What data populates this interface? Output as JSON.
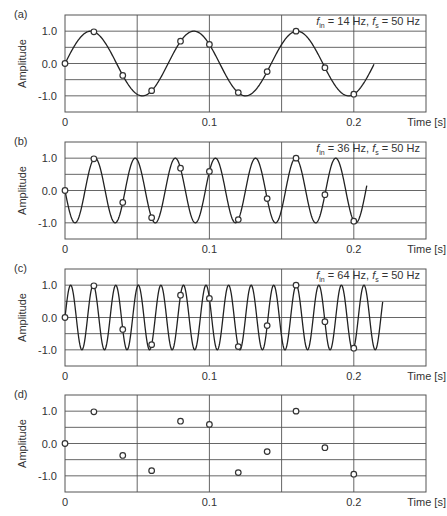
{
  "chart_data": [
    {
      "type": "line",
      "panel_label": "(a)",
      "annotation": {
        "fin_symbol": "f",
        "fin_sub": "in",
        "fin_value": " = 14 Hz, ",
        "fs_symbol": "f",
        "fs_sub": "s",
        "fs_value": " = 50 Hz"
      },
      "input_frequency_hz": 14,
      "sampling_frequency_hz": 50,
      "curve": {
        "formula": "sin(2*pi*14*t)",
        "sign": 1,
        "t_range": [
          0,
          0.214
        ]
      },
      "show_curve": true,
      "samples": {
        "t": [
          0,
          0.02,
          0.04,
          0.06,
          0.08,
          0.1,
          0.12,
          0.14,
          0.16,
          0.18,
          0.2
        ],
        "values": [
          0.0,
          0.98,
          -0.37,
          -0.84,
          0.69,
          0.59,
          -0.9,
          -0.25,
          1.0,
          -0.13,
          -0.95
        ]
      },
      "xlabel": "Time [s]",
      "ylabel": "Amplitude",
      "xlim": [
        0,
        0.25
      ],
      "ylim": [
        -1.5,
        1.5
      ],
      "xticks": [
        0,
        0.1,
        0.2
      ],
      "xtick_labels": [
        "0",
        "0.1",
        "0.2"
      ],
      "yticks": [
        1.0,
        0.0,
        -1.0
      ],
      "ytick_labels": [
        "1.0",
        "0.0",
        "-1.0"
      ],
      "grid": true
    },
    {
      "type": "line",
      "panel_label": "(b)",
      "annotation": {
        "fin_symbol": "f",
        "fin_sub": "in",
        "fin_value": " = 36 Hz, ",
        "fs_symbol": "f",
        "fs_sub": "s",
        "fs_value": " = 50 Hz"
      },
      "input_frequency_hz": 36,
      "sampling_frequency_hz": 50,
      "curve": {
        "formula": "-sin(2*pi*36*t)",
        "sign": -1,
        "t_range": [
          0,
          0.209
        ]
      },
      "show_curve": true,
      "samples": {
        "t": [
          0,
          0.02,
          0.04,
          0.06,
          0.08,
          0.1,
          0.12,
          0.14,
          0.16,
          0.18,
          0.2
        ],
        "values": [
          0.0,
          0.98,
          -0.37,
          -0.84,
          0.69,
          0.59,
          -0.9,
          -0.25,
          1.0,
          -0.13,
          -0.95
        ]
      },
      "xlabel": "Time [s]",
      "ylabel": "Amplitude",
      "xlim": [
        0,
        0.25
      ],
      "ylim": [
        -1.5,
        1.5
      ],
      "xticks": [
        0,
        0.1,
        0.2
      ],
      "xtick_labels": [
        "0",
        "0.1",
        "0.2"
      ],
      "yticks": [
        1.0,
        0.0,
        -1.0
      ],
      "ytick_labels": [
        "1.0",
        "0.0",
        "-1.0"
      ],
      "grid": true
    },
    {
      "type": "line",
      "panel_label": "(c)",
      "annotation": {
        "fin_symbol": "f",
        "fin_sub": "in",
        "fin_value": " = 64 Hz, ",
        "fs_symbol": "f",
        "fs_sub": "s",
        "fs_value": " = 50 Hz"
      },
      "input_frequency_hz": 64,
      "sampling_frequency_hz": 50,
      "curve": {
        "formula": "sin(2*pi*64*t)",
        "sign": 1,
        "t_range": [
          0,
          0.22
        ]
      },
      "show_curve": true,
      "samples": {
        "t": [
          0,
          0.02,
          0.04,
          0.06,
          0.08,
          0.1,
          0.12,
          0.14,
          0.16,
          0.18,
          0.2
        ],
        "values": [
          0.0,
          0.98,
          -0.37,
          -0.84,
          0.69,
          0.59,
          -0.9,
          -0.25,
          1.0,
          -0.13,
          -0.95
        ]
      },
      "xlabel": "Time [s]",
      "ylabel": "Amplitude",
      "xlim": [
        0,
        0.25
      ],
      "ylim": [
        -1.5,
        1.5
      ],
      "xticks": [
        0,
        0.1,
        0.2
      ],
      "xtick_labels": [
        "0",
        "0.1",
        "0.2"
      ],
      "yticks": [
        1.0,
        0.0,
        -1.0
      ],
      "ytick_labels": [
        "1.0",
        "0.0",
        "-1.0"
      ],
      "grid": true
    },
    {
      "type": "scatter",
      "panel_label": "(d)",
      "annotation": null,
      "show_curve": false,
      "samples": {
        "t": [
          0,
          0.02,
          0.04,
          0.06,
          0.08,
          0.1,
          0.12,
          0.14,
          0.16,
          0.18,
          0.2
        ],
        "values": [
          0.0,
          0.98,
          -0.37,
          -0.84,
          0.69,
          0.59,
          -0.9,
          -0.25,
          1.0,
          -0.13,
          -0.95
        ]
      },
      "xlabel": "Time [s]",
      "ylabel": "Amplitude",
      "xlim": [
        0,
        0.25
      ],
      "ylim": [
        -1.5,
        1.5
      ],
      "xticks": [
        0,
        0.1,
        0.2
      ],
      "xtick_labels": [
        "0",
        "0.1",
        "0.2"
      ],
      "yticks": [
        1.0,
        0.0,
        -1.0
      ],
      "ytick_labels": [
        "1.0",
        "0.0",
        "-1.0"
      ],
      "grid": true
    }
  ],
  "layout": {
    "plot_left": 65,
    "plot_right": 426,
    "panel_tops": [
      15,
      142,
      269,
      395
    ],
    "panel_height": 97
  }
}
